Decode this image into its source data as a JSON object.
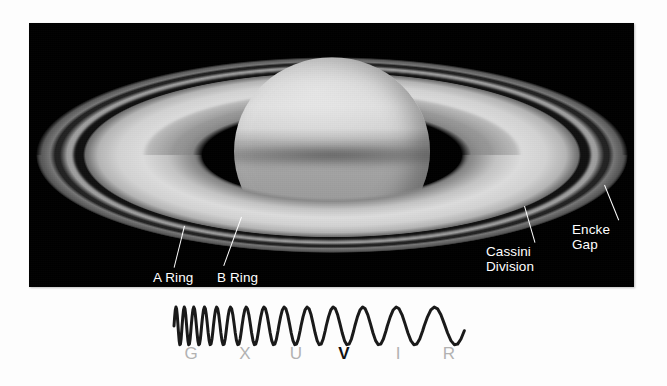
{
  "figure": {
    "background_color": "#000000",
    "annotations": [
      {
        "id": "a-ring",
        "label": "A Ring",
        "target": "a-ring-band",
        "color": "#ffffff"
      },
      {
        "id": "b-ring",
        "label": "B Ring",
        "target": "b-ring-band",
        "color": "#ffffff"
      },
      {
        "id": "cassini-division",
        "label": "Cassini\nDivision",
        "target": "cassini-division-gap",
        "color": "#ffffff"
      },
      {
        "id": "encke-gap",
        "label": "Encke\nGap",
        "target": "encke-gap-line",
        "color": "#ffffff"
      }
    ]
  },
  "spectrum": {
    "description": "electromagnetic spectrum wave, wavelength increasing left to right",
    "wave_color": "#1a1a1a",
    "label_color": "#b2b2b2",
    "highlight_color": "#111111",
    "highlight_band": "V",
    "bands": [
      {
        "letter": "G",
        "name": "Gamma ray",
        "x_percent": 7
      },
      {
        "letter": "X",
        "name": "X-ray",
        "x_percent": 25
      },
      {
        "letter": "U",
        "name": "Ultraviolet",
        "x_percent": 42
      },
      {
        "letter": "V",
        "name": "Visible",
        "x_percent": 58
      },
      {
        "letter": "I",
        "name": "Infrared",
        "x_percent": 76
      },
      {
        "letter": "R",
        "name": "Radio",
        "x_percent": 93
      }
    ]
  },
  "chart_data": {
    "type": "line",
    "xlabel": "",
    "ylabel": "",
    "categories": [
      "G",
      "X",
      "U",
      "V",
      "I",
      "R"
    ],
    "values": [
      1,
      1,
      1,
      1,
      1,
      1
    ]
  }
}
